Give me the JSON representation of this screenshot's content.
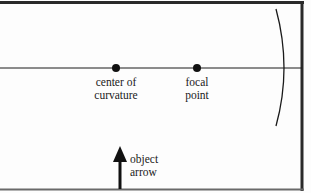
{
  "diagram": {
    "type": "concave-mirror-ray-diagram",
    "colors": {
      "background": "#fdfdfd",
      "ink": "#1a1a1a",
      "frame": "#2a2a2a"
    },
    "points": [
      {
        "id": "center_of_curvature",
        "label_line1": "center of",
        "label_line2": "curvature",
        "x": 116,
        "y": 68
      },
      {
        "id": "focal_point",
        "label_line1": "focal",
        "label_line2": "point",
        "x": 197,
        "y": 68
      }
    ],
    "object": {
      "label_line1": "object",
      "label_line2": "arrow",
      "x": 119,
      "y_base": 189,
      "y_tip": 146
    },
    "mirror": {
      "type": "concave",
      "label": ""
    },
    "principal_axis": {
      "y": 68
    }
  }
}
